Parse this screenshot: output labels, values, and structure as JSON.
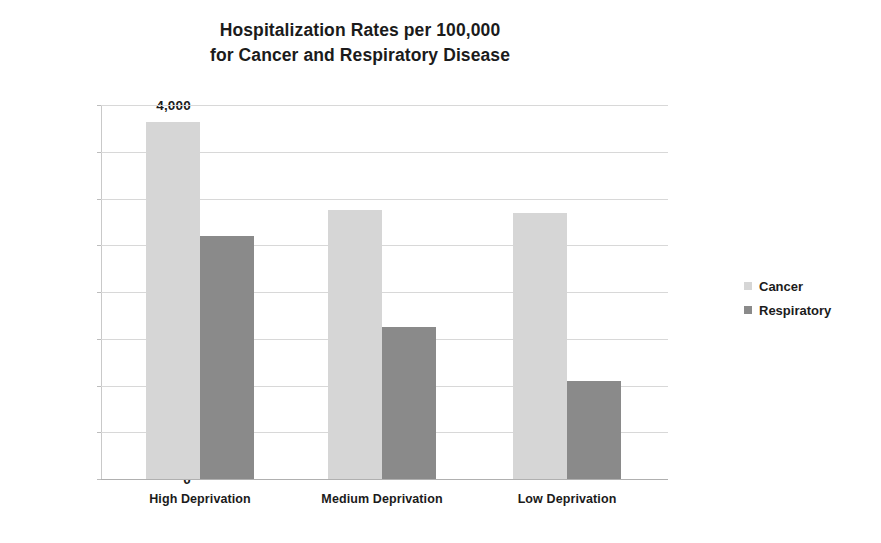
{
  "chart_data": {
    "type": "bar",
    "title": "Hospitalization Rates per 100,000 for Cancer and Respiratory Disease",
    "title_lines": [
      "Hospitalization Rates per 100,000",
      "for Cancer and Respiratory Disease"
    ],
    "categories": [
      "High Deprivation",
      "Medium Deprivation",
      "Low Deprivation"
    ],
    "series": [
      {
        "name": "Cancer",
        "color": "#d6d6d6",
        "values": [
          3820,
          2880,
          2840
        ]
      },
      {
        "name": "Respiratory",
        "color": "#8a8a8a",
        "values": [
          2600,
          1630,
          1050
        ]
      }
    ],
    "xlabel": "",
    "ylabel": "",
    "ylim": [
      0,
      4000
    ],
    "ytick_values": [
      4000,
      3500,
      3000,
      2500,
      2000,
      1500,
      1000,
      500,
      0
    ],
    "ytick_labels": [
      "4,000",
      "3,500",
      "3,000",
      "2,500",
      "2,000",
      "1,500",
      "1,000",
      "500",
      "0"
    ],
    "grid": true,
    "legend_position": "right",
    "legend_entries": [
      "Cancer",
      "Respiratory"
    ]
  }
}
